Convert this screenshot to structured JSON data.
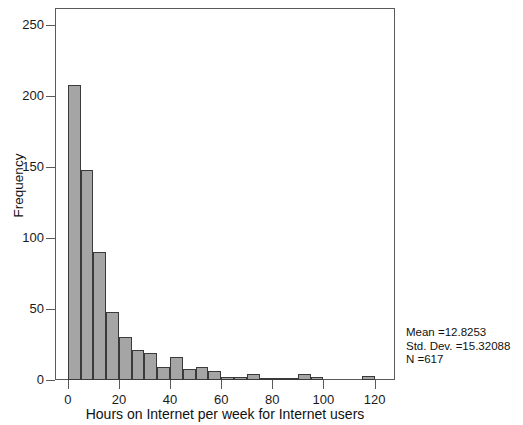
{
  "chart_data": {
    "type": "bar",
    "title": "",
    "subtitle": "",
    "xlabel": "Hours on Internet per week for Internet users",
    "ylabel": "Frequency",
    "xlim": [
      -5,
      128
    ],
    "ylim": [
      0,
      262
    ],
    "grid": false,
    "legend": null,
    "bin_width": 5,
    "x_ticks": [
      0,
      20,
      40,
      60,
      80,
      100,
      120
    ],
    "x_tick_labels": [
      "0",
      "20",
      "40",
      "60",
      "80",
      "100",
      "120"
    ],
    "y_ticks": [
      0,
      50,
      100,
      150,
      200,
      250
    ],
    "y_tick_labels": [
      "0",
      "50",
      "100",
      "150",
      "200",
      "250"
    ],
    "bar_fill": "#a5a5a5",
    "bar_edge": "#3a3a3a",
    "bins": [
      {
        "x0": 0,
        "x1": 5,
        "value": 208
      },
      {
        "x0": 5,
        "x1": 10,
        "value": 148
      },
      {
        "x0": 10,
        "x1": 15,
        "value": 90
      },
      {
        "x0": 15,
        "x1": 20,
        "value": 48
      },
      {
        "x0": 20,
        "x1": 25,
        "value": 30
      },
      {
        "x0": 25,
        "x1": 30,
        "value": 21
      },
      {
        "x0": 30,
        "x1": 35,
        "value": 19
      },
      {
        "x0": 35,
        "x1": 40,
        "value": 9
      },
      {
        "x0": 40,
        "x1": 45,
        "value": 16
      },
      {
        "x0": 45,
        "x1": 50,
        "value": 8
      },
      {
        "x0": 50,
        "x1": 55,
        "value": 9
      },
      {
        "x0": 55,
        "x1": 60,
        "value": 6
      },
      {
        "x0": 60,
        "x1": 65,
        "value": 2
      },
      {
        "x0": 65,
        "x1": 70,
        "value": 2
      },
      {
        "x0": 70,
        "x1": 75,
        "value": 4
      },
      {
        "x0": 75,
        "x1": 80,
        "value": 1
      },
      {
        "x0": 80,
        "x1": 85,
        "value": 1
      },
      {
        "x0": 85,
        "x1": 90,
        "value": 1
      },
      {
        "x0": 90,
        "x1": 95,
        "value": 4
      },
      {
        "x0": 95,
        "x1": 100,
        "value": 2
      },
      {
        "x0": 100,
        "x1": 105,
        "value": 0
      },
      {
        "x0": 105,
        "x1": 110,
        "value": 0
      },
      {
        "x0": 110,
        "x1": 115,
        "value": 0
      },
      {
        "x0": 115,
        "x1": 120,
        "value": 3
      }
    ],
    "annotations": {
      "mean_line": "Mean =12.8253",
      "std_dev_line": "Std. Dev. =15.32088",
      "n_line": "N =617"
    },
    "statistics": {
      "mean": 12.8253,
      "std_dev": 15.32088,
      "n": 617
    }
  }
}
